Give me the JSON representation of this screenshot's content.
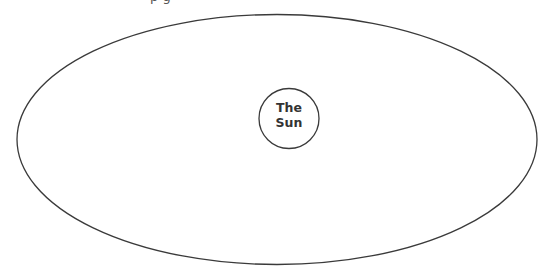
{
  "diagram": {
    "type": "orbit",
    "top_text_fragment": "p g",
    "orbit": {
      "shape": "ellipse",
      "cx": 277,
      "cy": 139.5,
      "rx": 260,
      "ry": 125,
      "stroke": "#333333"
    },
    "sun": {
      "label_line1": "The",
      "label_line2": "Sun",
      "cx": 289,
      "cy": 118.5,
      "r": 30,
      "stroke": "#333333"
    }
  }
}
